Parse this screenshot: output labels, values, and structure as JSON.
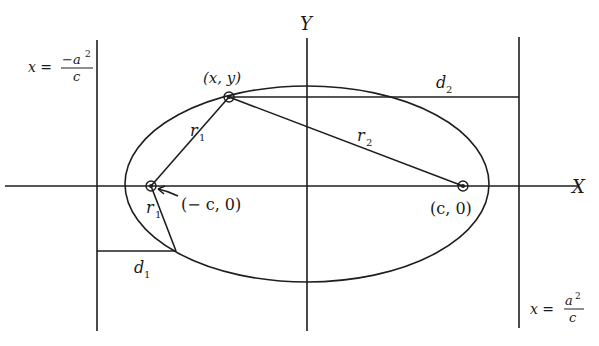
{
  "diagram": {
    "axes": {
      "x_label": "X",
      "y_label": "Y"
    },
    "foci": [
      {
        "label": "(− c, 0)",
        "name": "left-focus"
      },
      {
        "label": "(c, 0)",
        "name": "right-focus"
      }
    ],
    "point": {
      "label": "(x, y)"
    },
    "segments": {
      "r1_upper": {
        "name": "r",
        "sub": "1"
      },
      "r1_lower": {
        "name": "r",
        "sub": "1"
      },
      "r2": {
        "name": "r",
        "sub": "2"
      },
      "d1": {
        "name": "d",
        "sub": "1"
      },
      "d2": {
        "name": "d",
        "sub": "2"
      }
    },
    "directrices": {
      "left": {
        "lhs": "x =",
        "numerator": "−a",
        "exp": "2",
        "denominator": "c"
      },
      "right": {
        "lhs": "x =",
        "numerator": "a",
        "exp": "2",
        "denominator": "c"
      }
    },
    "colors": {
      "ink": "#1e1e1e",
      "background": "#ffffff"
    }
  }
}
